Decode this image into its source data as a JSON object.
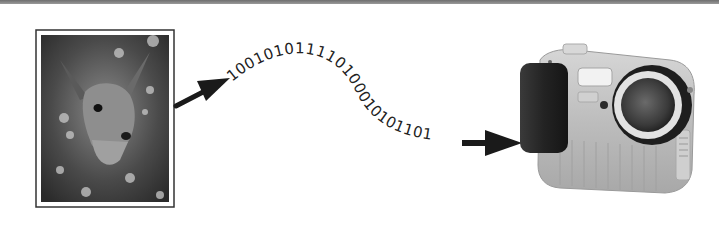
{
  "diagram": {
    "photo": {
      "label": "deer-photograph"
    },
    "binary_stream": {
      "text": "100101011110100010101101"
    },
    "camera": {
      "label": "digital-camera"
    },
    "colors": {
      "frame": "#333333",
      "arrow": "#1a1a1a",
      "camera_body": "#bdbdbd",
      "camera_grip": "#2a2a2a",
      "lens": "#3a3a3a",
      "top_bar": "#7a7a7a"
    }
  }
}
